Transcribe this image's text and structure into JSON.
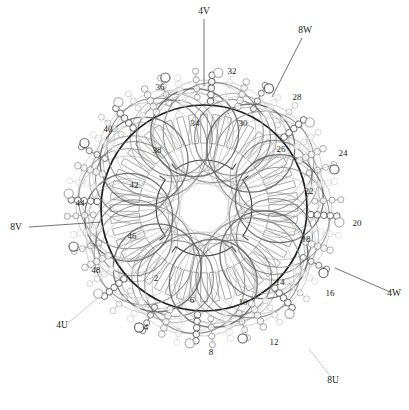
{
  "diagram": {
    "type": "stator-winding-cross-section",
    "slot_count": 48,
    "geometry": {
      "center_x": 204,
      "center_y": 208,
      "bore_radius": 48,
      "core_inner_radius": 62,
      "core_outer_radius": 103,
      "endturn_arc_radius": 62,
      "endturn_ring_radius": 76,
      "endturn_lobes": 8
    },
    "colors": {
      "core_outline": "#1f1f1f",
      "slot_outline": "#9a9a9a",
      "bore_outline": "#4a4a4a",
      "phase_u": "#8e8e8e",
      "phase_v": "#c9c9c9",
      "phase_w": "#5f5f5f",
      "conductor_fill": "#ffffff",
      "label_text": "#1a1a1a",
      "leader_line": "#6b6b6b"
    },
    "slot_numbers": [
      {
        "n": "2",
        "x": 156,
        "y": 281,
        "angle": 191.25
      },
      {
        "n": "4",
        "x": 146,
        "y": 330,
        "angle": 213.75
      },
      {
        "n": "6",
        "x": 192,
        "y": 303,
        "angle": 236.25
      },
      {
        "n": "8",
        "x": 211,
        "y": 355,
        "angle": 258.75
      },
      {
        "n": "10",
        "x": 243,
        "y": 305,
        "angle": 281.25
      },
      {
        "n": "12",
        "x": 274,
        "y": 345,
        "angle": 303.75
      },
      {
        "n": "14",
        "x": 280,
        "y": 285,
        "angle": 326.25
      },
      {
        "n": "16",
        "x": 330,
        "y": 296,
        "angle": 348.75
      },
      {
        "n": "18",
        "x": 306,
        "y": 242,
        "angle": 11.25
      },
      {
        "n": "20",
        "x": 357,
        "y": 226,
        "angle": 33.75
      },
      {
        "n": "22",
        "x": 309,
        "y": 194,
        "angle": 56.25
      },
      {
        "n": "24",
        "x": 343,
        "y": 156,
        "angle": 78.75
      },
      {
        "n": "26",
        "x": 281,
        "y": 152,
        "angle": 101.25
      },
      {
        "n": "28",
        "x": 297,
        "y": 100,
        "angle": 123.75
      },
      {
        "n": "30",
        "x": 243,
        "y": 126,
        "angle": 146.25
      },
      {
        "n": "32",
        "x": 232,
        "y": 74,
        "angle": 168.75
      },
      {
        "n": "34",
        "x": 195,
        "y": 126,
        "angle": 191.25
      },
      {
        "n": "36",
        "x": 160,
        "y": 90,
        "angle": 213.75
      },
      {
        "n": "38",
        "x": 157,
        "y": 153,
        "angle": 236.25
      },
      {
        "n": "40",
        "x": 108,
        "y": 132,
        "angle": 258.75
      },
      {
        "n": "42",
        "x": 134,
        "y": 188,
        "angle": 281.25
      },
      {
        "n": "44",
        "x": 80,
        "y": 206,
        "angle": 303.75
      },
      {
        "n": "46",
        "x": 132,
        "y": 239,
        "angle": 326.25
      },
      {
        "n": "48",
        "x": 96,
        "y": 273,
        "angle": 348.75
      }
    ],
    "phase_leads": [
      {
        "label": "4V",
        "text_x": 204,
        "text_y": 14,
        "line": [
          204,
          19,
          204,
          86
        ],
        "tone": "w"
      },
      {
        "label": "8W",
        "text_x": 305,
        "text_y": 33,
        "line": [
          302,
          38,
          272,
          97
        ],
        "tone": "w"
      },
      {
        "label": "4W",
        "text_x": 394,
        "text_y": 296,
        "line": [
          390,
          292,
          335,
          268
        ],
        "tone": "w"
      },
      {
        "label": "8U",
        "text_x": 333,
        "text_y": 383,
        "line": [
          331,
          377,
          309,
          349
        ],
        "tone": "v"
      },
      {
        "label": "4U",
        "text_x": 62,
        "text_y": 328,
        "line": [
          68,
          323,
          99,
          297
        ],
        "tone": "v"
      },
      {
        "label": "8V",
        "text_x": 16,
        "text_y": 230,
        "line": [
          29,
          227,
          102,
          222
        ],
        "tone": "u"
      }
    ]
  }
}
